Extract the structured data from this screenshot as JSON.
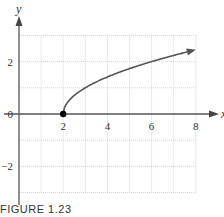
{
  "chart_data": {
    "type": "line",
    "title": "",
    "caption": "FIGURE 1.23",
    "xlabel": "x",
    "ylabel": "y",
    "xlim": [
      0,
      8
    ],
    "ylim": [
      -3,
      3
    ],
    "x_ticks": [
      2,
      4,
      6,
      8
    ],
    "x_tick_labels": [
      "2",
      "4",
      "6",
      "8"
    ],
    "y_ticks": [
      -2,
      0,
      2
    ],
    "y_tick_labels": [
      "−2",
      "0",
      "2"
    ],
    "grid": true,
    "grid_step": {
      "x": 1,
      "y": 1
    },
    "series": [
      {
        "name": "y = sqrt(x - 2)",
        "color": "#555555",
        "start_point": {
          "x": 2,
          "y": 0,
          "marker": "filled-circle"
        },
        "end_arrow": true,
        "x": [
          2,
          2.25,
          2.5,
          3,
          3.5,
          4,
          4.5,
          5,
          5.5,
          6,
          6.5,
          7,
          7.5,
          8
        ],
        "values": [
          0,
          0.5,
          0.71,
          1,
          1.22,
          1.41,
          1.58,
          1.73,
          1.87,
          2,
          2.12,
          2.24,
          2.35,
          2.45
        ]
      }
    ],
    "legend": null
  },
  "figure": {
    "caption": "FIGURE 1.23",
    "axis_label_x": "x",
    "axis_label_y": "y"
  }
}
